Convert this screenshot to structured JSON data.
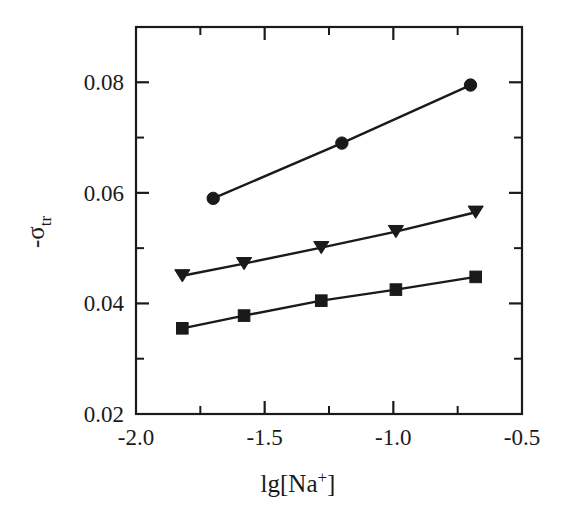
{
  "chart_data": {
    "type": "line",
    "title": "",
    "subtitle": "",
    "xlabel": "lg[Na+]",
    "xlabel_parts": {
      "base": "lg[Na",
      "sup": "+",
      "tail": "]"
    },
    "ylabel": "-σtr",
    "ylabel_parts": {
      "minus": "-",
      "symbol": "σ",
      "sub": "tr"
    },
    "xlim": [
      -2.0,
      -0.5
    ],
    "ylim": [
      0.02,
      0.09
    ],
    "xticks": [
      -2.0,
      -1.5,
      -1.0,
      -0.5
    ],
    "xtick_labels": [
      "-2.0",
      "-1.5",
      "-1.0",
      "-0.5"
    ],
    "xticks_minor": [
      -1.75,
      -1.25,
      -0.75
    ],
    "yticks": [
      0.02,
      0.04,
      0.06,
      0.08
    ],
    "ytick_labels": [
      "0.02",
      "0.04",
      "0.06",
      "0.08"
    ],
    "yticks_minor": [
      0.03,
      0.05,
      0.07
    ],
    "grid": false,
    "legend": "none",
    "series": [
      {
        "name": "series-circle",
        "marker": "circle",
        "color": "#1a1a1a",
        "x": [
          -1.7,
          -1.2,
          -0.7
        ],
        "y": [
          0.059,
          0.069,
          0.0795
        ]
      },
      {
        "name": "series-triangle-down",
        "marker": "triangle-down",
        "color": "#1a1a1a",
        "x": [
          -1.82,
          -1.58,
          -1.28,
          -0.99,
          -0.68
        ],
        "y": [
          0.045,
          0.0472,
          0.0501,
          0.053,
          0.0565
        ]
      },
      {
        "name": "series-square",
        "marker": "square",
        "color": "#1a1a1a",
        "x": [
          -1.82,
          -1.58,
          -1.28,
          -0.99,
          -0.68
        ],
        "y": [
          0.0355,
          0.0378,
          0.0405,
          0.0425,
          0.0448
        ]
      }
    ]
  }
}
